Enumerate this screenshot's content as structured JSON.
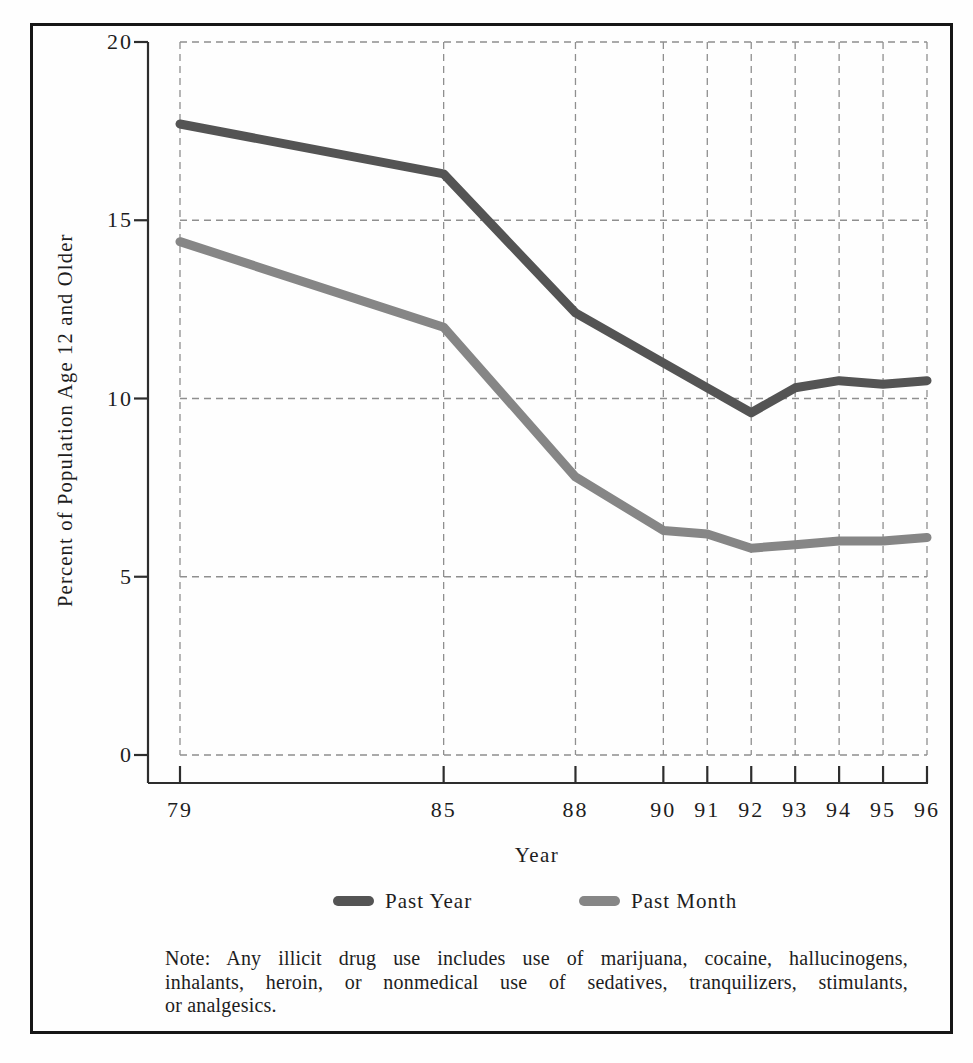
{
  "figure": {
    "y_axis_label": "Percent of Population Age 12 and Older",
    "x_axis_label": "Year",
    "legend": [
      {
        "label": "Past Year",
        "color": "#545454"
      },
      {
        "label": "Past Month",
        "color": "#868686"
      }
    ],
    "note": {
      "lines": [
        "Note: Any illicit drug use includes use of marijuana, cocaine, hallucinogens,",
        "inhalants, heroin, or nonmedical use of sedatives, tranquilizers, stimulants,",
        "or analgesics."
      ]
    },
    "colors": {
      "frame_border": "#161616",
      "axis": "#2d2d2d",
      "grid": "#8f8f8f",
      "background": "#fefefe"
    }
  },
  "chart_data": {
    "type": "line",
    "title": "",
    "xlabel": "Year",
    "ylabel": "Percent of Population Age 12 and Older",
    "x": [
      79,
      85,
      88,
      90,
      91,
      92,
      93,
      94,
      95,
      96
    ],
    "x_tick_labels": [
      "79",
      "85",
      "88",
      "90",
      "91",
      "92",
      "93",
      "94",
      "95",
      "96"
    ],
    "xlim": [
      79,
      96
    ],
    "ylim": [
      0,
      20
    ],
    "y_ticks": [
      0,
      5,
      10,
      15,
      20
    ],
    "grid": "dashed, both horizontal and vertical at every tick",
    "legend_position": "below chart, under x-axis label",
    "series": [
      {
        "name": "Past Year",
        "color": "#545454",
        "values": [
          17.7,
          16.3,
          12.4,
          11.0,
          10.3,
          9.6,
          10.3,
          10.5,
          10.4,
          10.5
        ]
      },
      {
        "name": "Past Month",
        "color": "#868686",
        "values": [
          14.4,
          12.0,
          7.8,
          6.3,
          6.2,
          5.8,
          5.9,
          6.0,
          6.0,
          6.1
        ]
      }
    ],
    "note": "Note: Any illicit drug use includes use of marijuana, cocaine, hallucinogens, inhalants, heroin, or nonmedical use of sedatives, tranquilizers, stimulants, or analgesics."
  }
}
